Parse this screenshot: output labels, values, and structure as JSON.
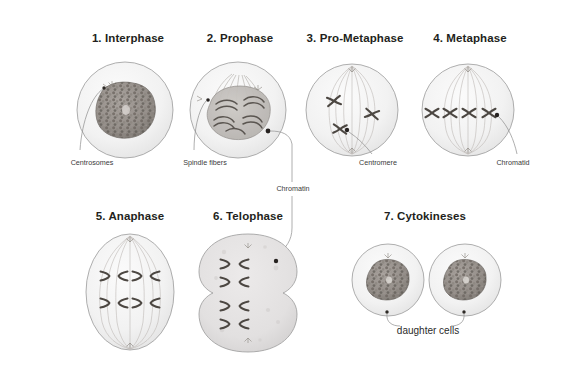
{
  "figure": {
    "background_color": "#ffffff",
    "ink_color": "#6f6f6f",
    "title_color": "#231f20"
  },
  "stages": [
    {
      "id": "interphase",
      "label": "1. Interphase",
      "title_x": 128,
      "title_y": 32,
      "cx": 125,
      "cy": 110
    },
    {
      "id": "prophase",
      "label": "2. Prophase",
      "title_x": 240,
      "title_y": 32,
      "cx": 238,
      "cy": 110
    },
    {
      "id": "pro-metaphase",
      "label": "3. Pro-Metaphase",
      "title_x": 355,
      "title_y": 32,
      "cx": 352,
      "cy": 110
    },
    {
      "id": "metaphase",
      "label": "4. Metaphase",
      "title_x": 470,
      "title_y": 32,
      "cx": 468,
      "cy": 110
    },
    {
      "id": "anaphase",
      "label": "5. Anaphase",
      "title_x": 130,
      "title_y": 210,
      "cx": 130,
      "cy": 292
    },
    {
      "id": "telophase",
      "label": "6. Telophase",
      "title_x": 248,
      "title_y": 210,
      "cx": 248,
      "cy": 292
    },
    {
      "id": "cytokineses",
      "label": "7. Cytokineses",
      "title_x": 425,
      "title_y": 210,
      "cx": 425,
      "cy": 280
    }
  ],
  "callouts": [
    {
      "id": "centrosomes",
      "label": "Centrosomes",
      "x": 92,
      "y": 160,
      "size": "small"
    },
    {
      "id": "spindle-fibers",
      "label": "Spindle fibers",
      "x": 205,
      "y": 160,
      "size": "small"
    },
    {
      "id": "centromere",
      "label": "Centromere",
      "x": 378,
      "y": 160,
      "size": "small"
    },
    {
      "id": "chromatid",
      "label": "Chromatid",
      "x": 513,
      "y": 160,
      "size": "small"
    },
    {
      "id": "chromatin",
      "label": "Chromatin",
      "x": 293,
      "y": 189,
      "size": "small"
    },
    {
      "id": "daughter-cells",
      "label": "daughter cells",
      "x": 428,
      "y": 332,
      "size": "big"
    }
  ]
}
